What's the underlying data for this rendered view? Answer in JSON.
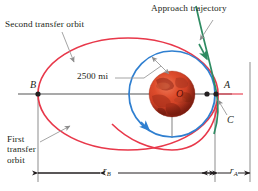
{
  "figure": {
    "title_alt": "Orbital transfer diagram",
    "labels": {
      "second_transfer_orbit": "Second transfer orbit",
      "approach_trajectory": "Approach trajectory",
      "first_transfer_orbit_line1": "First",
      "first_transfer_orbit_line2": "transfer",
      "first_transfer_orbit_line3": "orbit",
      "altitude": "2500 mi",
      "point_b": "B",
      "point_a": "A",
      "point_c": "C",
      "center_o": "O",
      "r_b_symbol": "r",
      "r_b_sub": "B",
      "r_a_symbol": "r",
      "r_a_sub": "A"
    },
    "colors": {
      "red_orbit": "#e8384a",
      "blue_orbit": "#2f7fd0",
      "green_trajectory": "#2e8b62",
      "axis_gray": "#8d8d8d",
      "leader_gray": "#9a9a9a",
      "dimension_black": "#231f20",
      "planet_base": "#d0412a",
      "planet_dark": "#9a2a18",
      "planet_light": "#e8704f",
      "text": "#231f20",
      "background": "#ffffff"
    },
    "geometry": {
      "center_x": 172,
      "center_y": 94,
      "planet_radius": 23,
      "blue_orbit_rx": 43,
      "blue_orbit_ry": 43,
      "red_ellipse_cx": 128,
      "red_ellipse_rx": 90,
      "red_ellipse_ry": 56,
      "point_b_x": 38,
      "point_a_x": 215,
      "point_c_x": 219,
      "r_b_span": "38 to 215",
      "r_a_span": "215 to 250"
    }
  }
}
